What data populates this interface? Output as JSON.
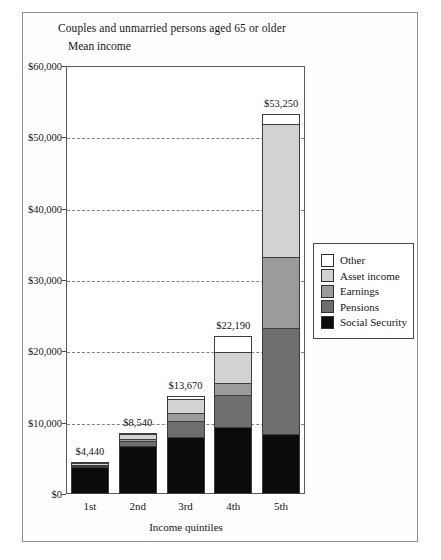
{
  "chart_data": {
    "type": "bar",
    "stacked": true,
    "title": "Couples and unmarried persons aged 65 or older",
    "subtitle": "Mean income",
    "xlabel": "Income quintiles",
    "ylabel": "",
    "categories": [
      "1st",
      "2nd",
      "3rd",
      "4th",
      "5th"
    ],
    "ylim": [
      0,
      60000
    ],
    "ytick_labels": [
      "$0",
      "$10,000",
      "$20,000",
      "$30,000",
      "$40,000",
      "$50,000",
      "$60,000"
    ],
    "ytick_values": [
      0,
      10000,
      20000,
      30000,
      40000,
      50000,
      60000
    ],
    "grid": true,
    "legend_position": "right",
    "totals": [
      4440,
      8540,
      13670,
      22190,
      53250
    ],
    "total_labels": [
      "$4,440",
      "$8,540",
      "$13,670",
      "$22,190",
      "$53,250"
    ],
    "series": [
      {
        "name": "Social Security",
        "color": "#0b0b0b",
        "values": [
          3810,
          6700,
          7940,
          9430,
          8400
        ]
      },
      {
        "name": "Pensions",
        "color": "#6e6e6e",
        "values": [
          260,
          660,
          2250,
          4450,
          14900
        ]
      },
      {
        "name": "Earnings",
        "color": "#9b9b9b",
        "values": [
          120,
          410,
          1180,
          1740,
          9900
        ]
      },
      {
        "name": "Asset income",
        "color": "#d2d2d2",
        "values": [
          180,
          620,
          1950,
          4230,
          18600
        ]
      },
      {
        "name": "Other",
        "color": "#ffffff",
        "values": [
          70,
          150,
          350,
          2340,
          1450
        ]
      }
    ],
    "legend": [
      {
        "label": "Other",
        "color": "#ffffff"
      },
      {
        "label": "Asset income",
        "color": "#d2d2d2"
      },
      {
        "label": "Earnings",
        "color": "#9b9b9b"
      },
      {
        "label": "Pensions",
        "color": "#6e6e6e"
      },
      {
        "label": "Social Security",
        "color": "#0b0b0b"
      }
    ]
  }
}
